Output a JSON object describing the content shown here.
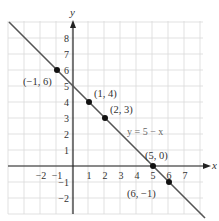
{
  "colors": {
    "grid": "#d9d9d9",
    "axis": "#222222",
    "line": "#555555",
    "point": "#111111",
    "text": "#333333",
    "equation_text": "#666666"
  },
  "axes": {
    "x_label": "x",
    "y_label": "y",
    "x_ticks": [
      {
        "value": -2,
        "label": "−2"
      },
      {
        "value": -1,
        "label": "−1"
      },
      {
        "value": 1,
        "label": "1"
      },
      {
        "value": 2,
        "label": "2"
      },
      {
        "value": 3,
        "label": "3"
      },
      {
        "value": 4,
        "label": "4"
      },
      {
        "value": 5,
        "label": "5"
      },
      {
        "value": 6,
        "label": "6"
      },
      {
        "value": 7,
        "label": "7"
      }
    ],
    "y_ticks": [
      {
        "value": 8,
        "label": "8"
      },
      {
        "value": 7,
        "label": "7"
      },
      {
        "value": 6,
        "label": "6"
      },
      {
        "value": 5,
        "label": "5"
      },
      {
        "value": 4,
        "label": "4"
      },
      {
        "value": 3,
        "label": "3"
      },
      {
        "value": 2,
        "label": "2"
      },
      {
        "value": 1,
        "label": "1"
      },
      {
        "value": -1,
        "label": "−1"
      },
      {
        "value": -2,
        "label": "−2"
      }
    ]
  },
  "line_label": "y = 5 − x",
  "points": [
    {
      "label": "(−1, 6)",
      "x": -1,
      "y": 6
    },
    {
      "label": "(1, 4)",
      "x": 1,
      "y": 4
    },
    {
      "label": "(2, 3)",
      "x": 2,
      "y": 3
    },
    {
      "label": "(5, 0)",
      "x": 5,
      "y": 0
    },
    {
      "label": "(6, −1)",
      "x": 6,
      "y": -1
    }
  ],
  "chart_data": {
    "type": "line",
    "title": "",
    "xlabel": "x",
    "ylabel": "y",
    "xlim": [
      -4,
      8
    ],
    "ylim": [
      -3,
      9
    ],
    "grid": true,
    "series": [
      {
        "name": "y = 5 − x",
        "x": [
          -4,
          8
        ],
        "y": [
          9,
          -3
        ]
      }
    ],
    "marked_points": [
      {
        "label": "(−1, 6)",
        "x": -1,
        "y": 6
      },
      {
        "label": "(1, 4)",
        "x": 1,
        "y": 4
      },
      {
        "label": "(2, 3)",
        "x": 2,
        "y": 3
      },
      {
        "label": "(5, 0)",
        "x": 5,
        "y": 0
      },
      {
        "label": "(6, −1)",
        "x": 6,
        "y": -1
      }
    ]
  }
}
